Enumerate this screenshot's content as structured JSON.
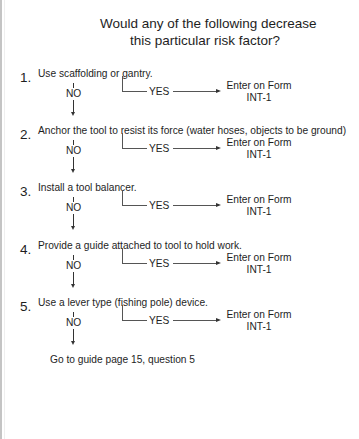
{
  "title": {
    "line1": "Would any of the following decrease",
    "line2": "this particular risk factor?"
  },
  "items": [
    {
      "number": "1.",
      "text": "Use scaffolding or gantry.",
      "no_label": "NO",
      "yes_label": "YES",
      "outcome_line1": "Enter on Form",
      "outcome_line2": "INT-1"
    },
    {
      "number": "2.",
      "text": "Anchor the tool to resist its force (water hoses, objects to be ground)",
      "no_label": "NO",
      "yes_label": "YES",
      "outcome_line1": "Enter on Form",
      "outcome_line2": "INT-1"
    },
    {
      "number": "3.",
      "text": "Install a tool balancer.",
      "no_label": "NO",
      "yes_label": "YES",
      "outcome_line1": "Enter on Form",
      "outcome_line2": "INT-1"
    },
    {
      "number": "4.",
      "text": "Provide a guide attached to tool to hold work.",
      "no_label": "NO",
      "yes_label": "YES",
      "outcome_line1": "Enter on Form",
      "outcome_line2": "INT-1"
    },
    {
      "number": "5.",
      "text": "Use a lever type (fishing pole) device.",
      "no_label": "NO",
      "yes_label": "YES",
      "outcome_line1": "Enter on Form",
      "outcome_line2": "INT-1"
    }
  ],
  "final_step": "Go to guide page 15, question 5",
  "colors": {
    "text": "#1e1e1e",
    "lines": "#555555",
    "page_edge": "#c4c4c4",
    "background": "#ffffff"
  }
}
